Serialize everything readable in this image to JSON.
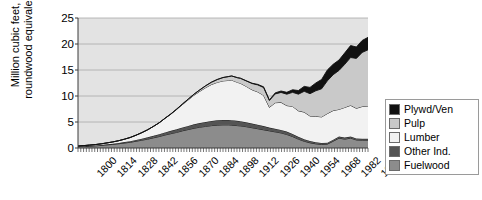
{
  "chart_data": {
    "type": "area",
    "stacked": true,
    "title": "",
    "subtitle": "",
    "xlabel": "",
    "ylabel": "Million cubic feet, roundwood equivalent",
    "ylabel_lines": [
      "Million cubic feet,",
      "roundwood equivalent"
    ],
    "ylim": [
      0,
      25
    ],
    "ytick_values": [
      0,
      5,
      10,
      15,
      20,
      25
    ],
    "ytick_labels": [
      "0",
      "5",
      "10",
      "15",
      "20",
      "25"
    ],
    "grid": true,
    "grid_axis": "y",
    "legend_position": "right",
    "xlim": [
      1800,
      2000
    ],
    "xtick_labels": [
      "1800",
      "1814",
      "1828",
      "1842",
      "1856",
      "1870",
      "1884",
      "1898",
      "1912",
      "1926",
      "1940",
      "1954",
      "1968",
      "1982",
      "1996"
    ],
    "xtick_values": [
      1800,
      1814,
      1828,
      1842,
      1856,
      1870,
      1884,
      1898,
      1912,
      1926,
      1940,
      1954,
      1968,
      1982,
      1996
    ],
    "x": [
      1800,
      1804,
      1808,
      1812,
      1816,
      1820,
      1824,
      1828,
      1832,
      1836,
      1840,
      1844,
      1848,
      1852,
      1856,
      1860,
      1864,
      1868,
      1872,
      1876,
      1880,
      1884,
      1888,
      1892,
      1896,
      1900,
      1904,
      1906,
      1910,
      1912,
      1916,
      1920,
      1924,
      1928,
      1932,
      1936,
      1940,
      1944,
      1948,
      1952,
      1956,
      1960,
      1964,
      1968,
      1972,
      1976,
      1980,
      1984,
      1988,
      1992,
      1996,
      2000
    ],
    "series": [
      {
        "name": "Fuelwood",
        "color": "#8c8c8c",
        "values": [
          0.25,
          0.3,
          0.36,
          0.42,
          0.5,
          0.6,
          0.7,
          0.82,
          0.95,
          1.1,
          1.3,
          1.5,
          1.7,
          1.95,
          2.2,
          2.5,
          2.75,
          3.0,
          3.3,
          3.55,
          3.8,
          4.0,
          4.15,
          4.3,
          4.4,
          4.45,
          4.45,
          4.4,
          4.3,
          4.25,
          4.1,
          3.9,
          3.7,
          3.5,
          3.3,
          3.1,
          2.9,
          2.6,
          2.2,
          1.7,
          1.3,
          1.0,
          0.8,
          0.7,
          0.75,
          1.3,
          1.9,
          1.7,
          1.9,
          1.55,
          1.5,
          1.5
        ]
      },
      {
        "name": "Other Ind.",
        "color": "#545454",
        "values": [
          0.05,
          0.06,
          0.07,
          0.08,
          0.1,
          0.12,
          0.14,
          0.16,
          0.19,
          0.22,
          0.26,
          0.3,
          0.35,
          0.4,
          0.45,
          0.5,
          0.55,
          0.6,
          0.65,
          0.7,
          0.75,
          0.8,
          0.85,
          0.9,
          0.92,
          0.95,
          0.95,
          0.95,
          0.92,
          0.9,
          0.85,
          0.8,
          0.78,
          0.72,
          0.62,
          0.6,
          0.58,
          0.55,
          0.5,
          0.45,
          0.4,
          0.35,
          0.3,
          0.28,
          0.27,
          0.3,
          0.32,
          0.3,
          0.3,
          0.28,
          0.28,
          0.28
        ]
      },
      {
        "name": "Lumber",
        "color": "#f2f2f2",
        "values": [
          0.08,
          0.1,
          0.13,
          0.16,
          0.2,
          0.26,
          0.33,
          0.42,
          0.55,
          0.7,
          0.9,
          1.15,
          1.45,
          1.8,
          2.2,
          2.7,
          3.2,
          3.8,
          4.4,
          5.0,
          5.6,
          6.1,
          6.6,
          7.0,
          7.3,
          7.5,
          7.6,
          7.7,
          7.4,
          7.3,
          6.9,
          6.5,
          6.3,
          5.9,
          3.9,
          5.0,
          5.3,
          5.0,
          5.3,
          5.0,
          5.2,
          4.8,
          5.0,
          5.0,
          5.6,
          5.6,
          5.2,
          5.8,
          6.0,
          5.8,
          6.2,
          6.3
        ]
      },
      {
        "name": "Pulp",
        "color": "#c9c9c9",
        "values": [
          0.0,
          0.0,
          0.0,
          0.0,
          0.0,
          0.0,
          0.0,
          0.0,
          0.0,
          0.0,
          0.0,
          0.0,
          0.0,
          0.0,
          0.0,
          0.02,
          0.04,
          0.07,
          0.1,
          0.15,
          0.2,
          0.28,
          0.36,
          0.45,
          0.55,
          0.65,
          0.75,
          0.8,
          0.9,
          0.95,
          1.05,
          1.2,
          1.35,
          1.5,
          1.3,
          1.7,
          1.9,
          2.2,
          2.7,
          3.2,
          4.0,
          4.3,
          4.9,
          5.4,
          6.3,
          6.9,
          7.5,
          8.3,
          9.2,
          9.6,
          10.4,
          10.8
        ]
      },
      {
        "name": "Plywd/Ven",
        "color": "#111111",
        "values": [
          0.0,
          0.0,
          0.0,
          0.0,
          0.0,
          0.0,
          0.0,
          0.0,
          0.0,
          0.0,
          0.0,
          0.0,
          0.0,
          0.0,
          0.0,
          0.0,
          0.0,
          0.0,
          0.0,
          0.0,
          0.0,
          0.0,
          0.0,
          0.0,
          0.0,
          0.0,
          0.0,
          0.0,
          0.0,
          0.02,
          0.04,
          0.06,
          0.1,
          0.14,
          0.12,
          0.2,
          0.28,
          0.36,
          0.5,
          0.7,
          0.95,
          1.2,
          1.5,
          1.8,
          2.1,
          2.0,
          2.0,
          2.2,
          2.3,
          2.2,
          2.3,
          2.4
        ]
      }
    ],
    "totals_note": "Stacked total peaks near 13 around 1906-1912, dips to about 6 in 1932, and rises to about 21 by 2000."
  },
  "legend": {
    "items": [
      {
        "label": "Plywd/Ven",
        "color": "#111111"
      },
      {
        "label": "Pulp",
        "color": "#c9c9c9"
      },
      {
        "label": "Lumber",
        "color": "#f2f2f2"
      },
      {
        "label": "Other Ind.",
        "color": "#545454"
      },
      {
        "label": "Fuelwood",
        "color": "#8c8c8c"
      }
    ]
  },
  "style": {
    "plot_background": "#e3e3e3",
    "grid_color": "#a8a8a8",
    "axis_color": "#3b3b3b",
    "line_color": "#111111"
  }
}
